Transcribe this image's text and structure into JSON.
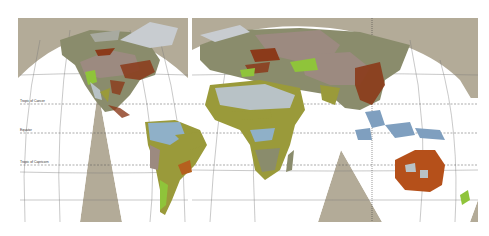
{
  "map": {
    "projection": "interrupted",
    "lines": {
      "tropic_cancer": "Tropic of Cancer",
      "equator": "Equator",
      "tropic_capricorn": "Tropic of Capricorn"
    },
    "colors": {
      "ocean_frame": "#b3ab98",
      "land_forest": "#8a8c6c",
      "land_desert": "#b8c2c6",
      "land_savanna": "#9a9a3a",
      "land_mountain": "#8b3a1a",
      "land_steppe": "#9c8a80",
      "land_grass": "#8fc43a",
      "land_tundra": "#a8aaa0",
      "ice": "#c8ccd0",
      "wetland": "#8fb0c8"
    }
  }
}
